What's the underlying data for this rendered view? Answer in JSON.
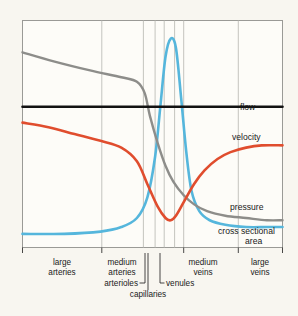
{
  "chart_data": {
    "type": "line",
    "title": "",
    "subtitle": "",
    "xlabel": "",
    "ylabel": "",
    "grid": "vertical",
    "legend_position": "right-inline",
    "xlim": [
      0,
      100
    ],
    "ylim": [
      0,
      100
    ],
    "x_segments": [
      {
        "key": "large-arteries",
        "label_line1": "large",
        "label_line2": "arteries",
        "x_start": 0,
        "x_end": 30.5
      },
      {
        "key": "medium-arteries",
        "label_line1": "medium",
        "label_line2": "arteries",
        "x_start": 30.5,
        "x_end": 46.5
      },
      {
        "key": "arterioles",
        "label_line1": "arterioles",
        "label_line2": "",
        "x_start": 46.5,
        "x_end": 54.0
      },
      {
        "key": "capillaries",
        "label_line1": "capillaries",
        "label_line2": "",
        "x_start": 54.0,
        "x_end": 62.0
      },
      {
        "key": "venules",
        "label_line1": "venules",
        "label_line2": "",
        "x_start": 62.0,
        "x_end": 70.0
      },
      {
        "key": "medium-veins",
        "label_line1": "medium",
        "label_line2": "veins",
        "x_start": 70.0,
        "x_end": 83.0
      },
      {
        "key": "large-veins",
        "label_line1": "large",
        "label_line2": "veins",
        "x_start": 83.0,
        "x_end": 100
      }
    ],
    "gridline_positions": [
      30.5,
      46.5,
      51.0,
      54.5,
      58.5,
      62.0,
      83.0
    ],
    "series": [
      {
        "name": "flow",
        "label": "flow",
        "color": "#121212",
        "description": "constant horizontal line",
        "points": [
          [
            0,
            62
          ],
          [
            100,
            62
          ]
        ]
      },
      {
        "name": "velocity",
        "label": "velocity",
        "color": "#e04d2e",
        "description": "high in arteries, minimum in capillaries, partial recovery in veins",
        "points": [
          [
            0,
            55
          ],
          [
            10,
            53
          ],
          [
            20,
            50
          ],
          [
            30,
            47
          ],
          [
            38,
            44
          ],
          [
            44,
            38
          ],
          [
            48,
            28
          ],
          [
            52,
            18
          ],
          [
            55,
            13
          ],
          [
            57,
            12
          ],
          [
            59,
            14
          ],
          [
            62,
            20
          ],
          [
            66,
            28
          ],
          [
            70,
            34
          ],
          [
            75,
            39
          ],
          [
            80,
            42
          ],
          [
            86,
            44
          ],
          [
            92,
            45
          ],
          [
            100,
            45
          ]
        ]
      },
      {
        "name": "pressure",
        "label": "pressure",
        "color": "#8d8d8a",
        "description": "highest in large arteries, steep drop across arterioles, low in veins",
        "points": [
          [
            0,
            86
          ],
          [
            12,
            82
          ],
          [
            26,
            78
          ],
          [
            38,
            75
          ],
          [
            44,
            73
          ],
          [
            47,
            68
          ],
          [
            49,
            58
          ],
          [
            52,
            46
          ],
          [
            55,
            36
          ],
          [
            58,
            29
          ],
          [
            62,
            23
          ],
          [
            66,
            19
          ],
          [
            71,
            16
          ],
          [
            78,
            14
          ],
          [
            86,
            13
          ],
          [
            94,
            12
          ],
          [
            100,
            12
          ]
        ]
      },
      {
        "name": "cross sectional area",
        "label_line1": "cross sectional",
        "label_line2": "area",
        "label": "cross sectional area",
        "color": "#55b6dc",
        "description": "low in arteries, enormous peak in capillaries, moderate in veins",
        "points": [
          [
            0,
            6
          ],
          [
            16,
            6
          ],
          [
            30,
            7
          ],
          [
            38,
            9
          ],
          [
            44,
            13
          ],
          [
            48,
            22
          ],
          [
            51,
            40
          ],
          [
            53,
            62
          ],
          [
            55,
            84
          ],
          [
            57,
            92
          ],
          [
            59,
            88
          ],
          [
            61,
            66
          ],
          [
            63,
            42
          ],
          [
            65,
            25
          ],
          [
            68,
            16
          ],
          [
            72,
            12
          ],
          [
            78,
            10
          ],
          [
            86,
            9
          ],
          [
            94,
            9
          ],
          [
            100,
            9
          ]
        ]
      }
    ],
    "series_labels": [
      {
        "key": "flow",
        "text": "flow",
        "x": 92,
        "y": 65.5
      },
      {
        "key": "velocity",
        "text": "velocity",
        "x": 92,
        "y": 51.5
      },
      {
        "key": "pressure",
        "text": "pressure",
        "x": 92,
        "y": 20.5
      },
      {
        "key": "cross-sectional-area",
        "text_line1": "cross sectional",
        "text_line2": "area",
        "x": 92,
        "y": 9
      }
    ]
  },
  "figure": {
    "background_color": "#f8f6f0",
    "plot_background_color": "#fdfcf8",
    "frame_color": "#9a9a96",
    "gridline_color": "#bdbdb8"
  },
  "labels": {
    "flow": "flow",
    "velocity": "velocity",
    "pressure": "pressure",
    "cross_sectional_line1": "cross sectional",
    "cross_sectional_line2": "area",
    "large_arteries_1": "large",
    "large_arteries_2": "arteries",
    "medium_arteries_1": "medium",
    "medium_arteries_2": "arteries",
    "arterioles": "arterioles",
    "capillaries": "capillaries",
    "venules": "venules",
    "medium_veins_1": "medium",
    "medium_veins_2": "veins",
    "large_veins_1": "large",
    "large_veins_2": "veins"
  }
}
